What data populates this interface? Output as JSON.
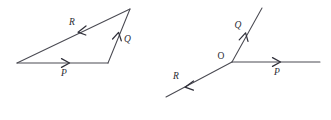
{
  "figure": {
    "background_color": "#ffffff",
    "line_color": "#4a4a52",
    "label_color": "#2b2b33",
    "diagrams": [
      {
        "name": "triangle-vector-addition",
        "description": "Closed vector triangle showing P plus Q equals R reversed",
        "vectors": [
          {
            "id": "P",
            "label": "P",
            "from": [
              17,
              63
            ],
            "to": [
              108,
              63
            ],
            "arrow_at": [
              68,
              63
            ],
            "direction": "right",
            "label_pos": [
              64,
              76
            ]
          },
          {
            "id": "Q",
            "label": "Q",
            "from": [
              108,
              63
            ],
            "to": [
              130,
              9
            ],
            "arrow_at": [
              120,
              35
            ],
            "direction": "up-right",
            "label_pos": [
              124,
              41
            ]
          },
          {
            "id": "R",
            "label": "R",
            "from": [
              130,
              9
            ],
            "to": [
              17,
              63
            ],
            "arrow_at": [
              79,
              32
            ],
            "direction": "down-left",
            "label_pos": [
              72,
              25
            ]
          }
        ]
      },
      {
        "name": "concurrent-rays-at-origin",
        "description": "Three rays P, Q, R emanating from common point O",
        "origin": {
          "id": "O",
          "label": "O",
          "point": [
            232,
            62
          ],
          "label_pos": [
            221,
            59
          ]
        },
        "vectors": [
          {
            "id": "P",
            "label": "P",
            "from": [
              232,
              62
            ],
            "to": [
              320,
              62
            ],
            "arrow_at": [
              279,
              62
            ],
            "direction": "right",
            "label_pos": [
              276,
              75
            ]
          },
          {
            "id": "Q",
            "label": "Q",
            "from": [
              232,
              62
            ],
            "to": [
              262,
              8
            ],
            "arrow_at": [
              246,
              35
            ],
            "direction": "up-right",
            "label_pos": [
              236,
              27
            ]
          },
          {
            "id": "R",
            "label": "R",
            "from": [
              232,
              62
            ],
            "to": [
              166,
              97
            ],
            "arrow_at": [
              188,
              85
            ],
            "direction": "down-left",
            "label_pos": [
              176,
              78
            ]
          }
        ]
      }
    ]
  }
}
